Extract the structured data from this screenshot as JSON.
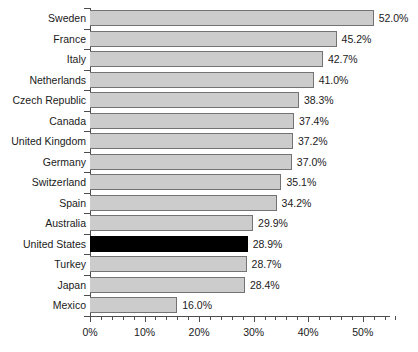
{
  "chart_data": {
    "type": "bar",
    "orientation": "horizontal",
    "title": "",
    "subtitle": "",
    "xlabel": "",
    "ylabel": "",
    "xlim": [
      0,
      56
    ],
    "grid": false,
    "legend": null,
    "value_suffix": "%",
    "categories": [
      "Sweden",
      "France",
      "Italy",
      "Netherlands",
      "Czech Republic",
      "Canada",
      "United Kingdom",
      "Germany",
      "Switzerland",
      "Spain",
      "Australia",
      "United States",
      "Turkey",
      "Japan",
      "Mexico"
    ],
    "values": [
      52.0,
      45.2,
      42.7,
      41.0,
      38.3,
      37.4,
      37.2,
      37.0,
      35.1,
      34.2,
      29.9,
      28.9,
      28.7,
      28.4,
      16.0
    ],
    "value_labels": [
      "52.0%",
      "45.2%",
      "42.7%",
      "41.0%",
      "38.3%",
      "37.4%",
      "37.2%",
      "37.0%",
      "35.1%",
      "34.2%",
      "29.9%",
      "28.9%",
      "28.7%",
      "28.4%",
      "16.0%"
    ],
    "highlight_category": "United States",
    "colors": {
      "bar_fill": "#cccccc",
      "bar_border": "#737373",
      "highlight_fill": "#000000",
      "axis": "#4d4d4d",
      "text": "#1a1a1a",
      "background": "#ffffff"
    },
    "x_ticks_major": [
      0,
      10,
      20,
      30,
      40,
      50
    ],
    "x_tick_labels": [
      "0%",
      "10%",
      "20%",
      "30%",
      "40%",
      "50%"
    ],
    "x_tick_minor_step": 2
  }
}
